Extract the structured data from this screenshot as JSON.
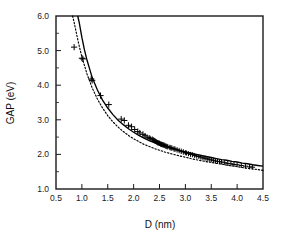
{
  "chart_data": {
    "type": "scatter",
    "title": "",
    "xlabel": "D (nm)",
    "ylabel": "GAP (eV)",
    "xlim": [
      0.5,
      4.5
    ],
    "ylim": [
      1.0,
      6.0
    ],
    "xticks": [
      0.5,
      1.0,
      1.5,
      2.0,
      2.5,
      3.0,
      3.5,
      4.0,
      4.5
    ],
    "xtick_labels": [
      "0.5",
      "1.0",
      "1.5",
      "2.0",
      "2.5",
      "3.0",
      "3.5",
      "4.0",
      "4.5"
    ],
    "yticks": [
      1.0,
      2.0,
      3.0,
      4.0,
      5.0,
      6.0
    ],
    "ytick_labels": [
      "1.0",
      "2.0",
      "3.0",
      "4.0",
      "5.0",
      "6.0"
    ],
    "grid": false,
    "legend": "none",
    "marker": "plus",
    "marker_color": "#000000",
    "series": [
      {
        "name": "measured gap",
        "type": "scatter",
        "marker": "plus",
        "x": [
          0.85,
          1.0,
          1.02,
          1.18,
          1.2,
          1.36,
          1.52,
          1.76,
          1.82,
          1.9,
          1.96,
          2.02,
          2.08,
          2.12,
          2.18,
          2.22,
          2.26,
          2.3,
          2.32,
          2.36,
          2.38,
          2.4,
          2.42,
          2.44,
          2.46,
          2.48,
          2.5,
          2.52,
          2.54,
          2.56,
          2.58,
          2.6,
          2.62,
          2.64,
          2.66,
          2.7,
          2.72,
          2.74,
          2.78,
          2.8,
          2.84,
          2.88,
          2.92,
          2.96,
          3.0,
          3.02,
          3.06,
          3.1,
          3.14,
          3.18,
          3.22,
          3.26,
          3.3,
          3.34,
          3.38,
          3.42,
          3.46,
          3.5,
          3.54,
          3.58,
          3.62,
          3.66,
          3.7,
          3.76,
          3.82,
          3.88,
          3.94,
          4.0,
          4.08,
          4.16,
          4.24,
          4.3
        ],
        "y": [
          5.1,
          4.78,
          4.76,
          4.18,
          4.14,
          3.7,
          3.44,
          3.02,
          2.98,
          2.84,
          2.8,
          2.72,
          2.66,
          2.62,
          2.58,
          2.54,
          2.5,
          2.48,
          2.46,
          2.44,
          2.42,
          2.4,
          2.38,
          2.36,
          2.34,
          2.33,
          2.32,
          2.3,
          2.29,
          2.28,
          2.27,
          2.26,
          2.24,
          2.23,
          2.22,
          2.2,
          2.19,
          2.18,
          2.16,
          2.15,
          2.13,
          2.11,
          2.09,
          2.07,
          2.05,
          2.04,
          2.02,
          2.0,
          1.99,
          1.97,
          1.95,
          1.94,
          1.92,
          1.9,
          1.89,
          1.87,
          1.86,
          1.84,
          1.83,
          1.81,
          1.8,
          1.79,
          1.78,
          1.76,
          1.74,
          1.73,
          1.71,
          1.7,
          1.68,
          1.66,
          1.64,
          1.63
        ]
      },
      {
        "name": "model fit (solid)",
        "type": "line",
        "style": "solid",
        "color": "#000000",
        "x": [
          0.92,
          0.95,
          1.0,
          1.05,
          1.1,
          1.2,
          1.3,
          1.4,
          1.5,
          1.6,
          1.7,
          1.8,
          1.9,
          2.0,
          2.1,
          2.2,
          2.3,
          2.4,
          2.5,
          2.6,
          2.7,
          2.8,
          2.9,
          3.0,
          3.1,
          3.2,
          3.3,
          3.4,
          3.5,
          3.6,
          3.7,
          3.8,
          3.9,
          4.0,
          4.1,
          4.2,
          4.3,
          4.4,
          4.5
        ],
        "y": [
          6.0,
          5.8,
          5.38,
          5.02,
          4.72,
          4.22,
          3.86,
          3.57,
          3.34,
          3.15,
          2.99,
          2.86,
          2.74,
          2.64,
          2.55,
          2.47,
          2.4,
          2.34,
          2.29,
          2.24,
          2.19,
          2.15,
          2.11,
          2.07,
          2.04,
          2.0,
          1.97,
          1.94,
          1.91,
          1.88,
          1.85,
          1.83,
          1.8,
          1.78,
          1.75,
          1.73,
          1.7,
          1.68,
          1.66
        ]
      },
      {
        "name": "model fit (dotted)",
        "type": "line",
        "style": "dotted",
        "color": "#000000",
        "x": [
          0.82,
          0.85,
          0.9,
          0.95,
          1.0,
          1.1,
          1.2,
          1.3,
          1.4,
          1.5,
          1.6,
          1.7,
          1.8,
          1.9,
          2.0,
          2.1,
          2.2,
          2.3,
          2.4,
          2.5,
          2.6,
          2.7,
          2.8,
          2.9,
          3.0,
          3.1,
          3.2,
          3.3,
          3.4,
          3.5,
          3.6,
          3.7,
          3.8,
          3.9,
          4.0,
          4.1,
          4.2,
          4.3,
          4.4,
          4.5
        ],
        "y": [
          6.0,
          5.82,
          5.46,
          5.12,
          4.82,
          4.32,
          3.92,
          3.6,
          3.34,
          3.12,
          2.94,
          2.79,
          2.66,
          2.55,
          2.45,
          2.37,
          2.29,
          2.23,
          2.17,
          2.12,
          2.07,
          2.03,
          1.99,
          1.95,
          1.92,
          1.88,
          1.85,
          1.82,
          1.79,
          1.77,
          1.74,
          1.72,
          1.69,
          1.67,
          1.65,
          1.62,
          1.6,
          1.58,
          1.56,
          1.54
        ]
      }
    ]
  },
  "figure": {
    "background": "#ffffff",
    "axis_color": "#1a1a1a"
  }
}
